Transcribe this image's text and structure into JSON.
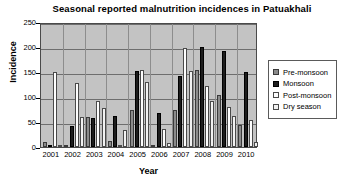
{
  "chart_data": {
    "type": "bar",
    "title": "Seasonal reported malnutrition incidences in Patuakhali",
    "xlabel": "Year",
    "ylabel": "Incidence",
    "ylim": [
      0,
      250
    ],
    "yticks": [
      0,
      50,
      100,
      150,
      200,
      250
    ],
    "grid": true,
    "legend_position": "right",
    "categories": [
      "2001",
      "2002",
      "2003",
      "2004",
      "2005",
      "2006",
      "2007",
      "2008",
      "2009",
      "2010"
    ],
    "series": [
      {
        "name": "Pre-monsoon",
        "color": "#8b8b8b",
        "values": [
          10,
          5,
          60,
          13,
          75,
          0,
          75,
          155,
          105,
          45
        ]
      },
      {
        "name": "Monsoon",
        "color": "#1d1d1d",
        "values": [
          0,
          42,
          58,
          62,
          152,
          68,
          143,
          200,
          192,
          150
        ]
      },
      {
        "name": "Post-monsoon",
        "color": "#fdfdfd",
        "values": [
          150,
          128,
          92,
          0,
          155,
          37,
          198,
          122,
          80,
          55
        ]
      },
      {
        "name": "Dry season",
        "color": "#f2f2f2",
        "values": [
          3,
          60,
          78,
          35,
          130,
          8,
          152,
          92,
          62,
          10
        ]
      }
    ]
  },
  "legend": {
    "items": [
      {
        "label": "Pre-monsoon"
      },
      {
        "label": "Monsoon"
      },
      {
        "label": "Post-monsoon"
      },
      {
        "label": "Dry season"
      }
    ]
  }
}
